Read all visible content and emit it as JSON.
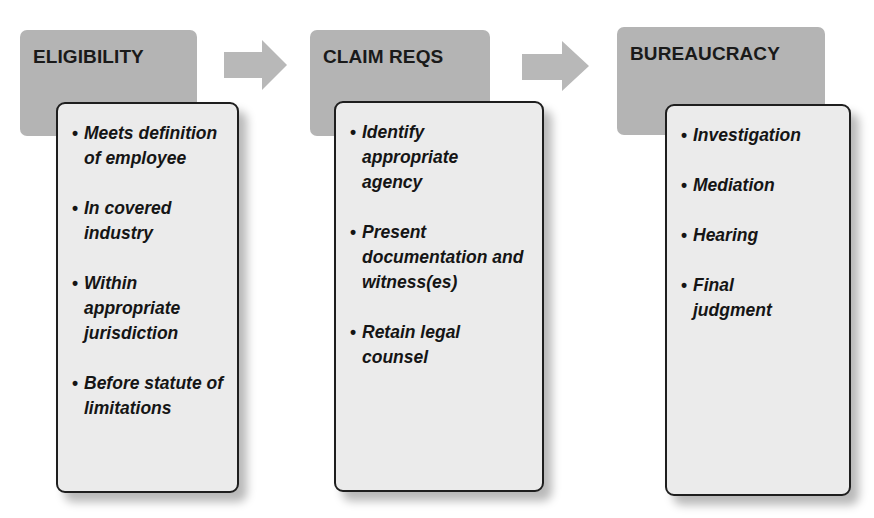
{
  "diagram": {
    "colors": {
      "header_fill": "#b4b4b4",
      "arrow_fill": "#b8b8b8",
      "card_fill": "#ebebeb",
      "card_border": "#1e1e1e",
      "text": "#151515"
    },
    "stages": [
      {
        "title": "ELIGIBILITY",
        "items": [
          "Meets definition of employee",
          "In covered industry",
          "Within appropriate jurisdiction",
          "Before statute of limitations"
        ]
      },
      {
        "title": "CLAIM REQS",
        "items": [
          "Identify appropriate agency",
          "Present documentation and witness(es)",
          "Retain legal counsel"
        ]
      },
      {
        "title": "BUREAUCRACY",
        "items": [
          "Investigation",
          "Mediation",
          "Hearing",
          "Final judgment"
        ]
      }
    ],
    "bullet": "•",
    "connectors": [
      "right-arrow",
      "right-arrow"
    ]
  }
}
